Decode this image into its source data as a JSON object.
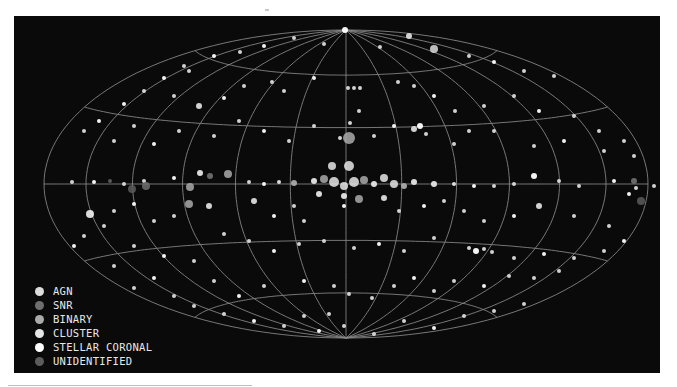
{
  "chart_data": {
    "type": "scatter",
    "title": "",
    "projection": "Hammer-Aitoff all-sky (galactic coordinates)",
    "grid": {
      "on": true,
      "meridians_deg": [
        -180,
        -150,
        -120,
        -90,
        -60,
        -30,
        0,
        30,
        60,
        90,
        120,
        150,
        180
      ],
      "parallels_deg": [
        -60,
        -30,
        0,
        30,
        60
      ],
      "color": "#8a8a8a"
    },
    "background": "#0a0a0a",
    "legend_position": "lower-left",
    "legend": [
      {
        "name": "AGN",
        "color": "#dcdcdc"
      },
      {
        "name": "SNR",
        "color": "#6e6e6e"
      },
      {
        "name": "BINARY",
        "color": "#aaaaaa"
      },
      {
        "name": "CLUSTER",
        "color": "#e6e6e6"
      },
      {
        "name": "STELLAR CORONAL",
        "color": "#ffffff"
      },
      {
        "name": "UNIDENTIFIED",
        "color": "#5c5c5c"
      }
    ],
    "ellipse": {
      "cx": 332,
      "cy": 168,
      "rx": 302,
      "ry": 154
    },
    "points": [
      [
        331,
        14,
        3,
        "STELLAR CORONAL"
      ],
      [
        395,
        20,
        3,
        "AGN"
      ],
      [
        420,
        33,
        4,
        "AGN"
      ],
      [
        366,
        31,
        2,
        "AGN"
      ],
      [
        310,
        28,
        2,
        "AGN"
      ],
      [
        280,
        22,
        2,
        "AGN"
      ],
      [
        250,
        30,
        2,
        "STELLAR CORONAL"
      ],
      [
        226,
        36,
        2,
        "AGN"
      ],
      [
        200,
        40,
        2,
        "STELLAR CORONAL"
      ],
      [
        455,
        40,
        2,
        "AGN"
      ],
      [
        480,
        46,
        2,
        "STELLAR CORONAL"
      ],
      [
        510,
        55,
        2,
        "AGN"
      ],
      [
        540,
        60,
        2,
        "AGN"
      ],
      [
        170,
        50,
        2,
        "AGN"
      ],
      [
        150,
        62,
        2,
        "STELLAR CORONAL"
      ],
      [
        130,
        75,
        2,
        "AGN"
      ],
      [
        110,
        88,
        2,
        "STELLAR CORONAL"
      ],
      [
        175,
        55,
        2,
        "AGN"
      ],
      [
        160,
        80,
        2,
        "AGN"
      ],
      [
        185,
        90,
        3,
        "AGN"
      ],
      [
        210,
        82,
        2,
        "STELLAR CORONAL"
      ],
      [
        230,
        70,
        2,
        "AGN"
      ],
      [
        258,
        66,
        2,
        "AGN"
      ],
      [
        270,
        75,
        2,
        "AGN"
      ],
      [
        300,
        62,
        2,
        "STELLAR CORONAL"
      ],
      [
        334,
        72,
        2,
        "AGN"
      ],
      [
        340,
        72,
        2,
        "AGN"
      ],
      [
        346,
        72,
        2,
        "AGN"
      ],
      [
        384,
        66,
        2,
        "AGN"
      ],
      [
        400,
        70,
        2,
        "AGN"
      ],
      [
        420,
        80,
        2,
        "STELLAR CORONAL"
      ],
      [
        441,
        95,
        2,
        "AGN"
      ],
      [
        455,
        115,
        2,
        "AGN"
      ],
      [
        470,
        90,
        2,
        "AGN"
      ],
      [
        500,
        80,
        2,
        "AGN"
      ],
      [
        525,
        95,
        2,
        "STELLAR CORONAL"
      ],
      [
        560,
        100,
        2,
        "AGN"
      ],
      [
        585,
        115,
        2,
        "AGN"
      ],
      [
        610,
        125,
        2,
        "AGN"
      ],
      [
        70,
        115,
        2,
        "AGN"
      ],
      [
        85,
        105,
        2,
        "STELLAR CORONAL"
      ],
      [
        100,
        125,
        2,
        "AGN"
      ],
      [
        120,
        110,
        2,
        "AGN"
      ],
      [
        140,
        128,
        2,
        "STELLAR CORONAL"
      ],
      [
        165,
        115,
        2,
        "AGN"
      ],
      [
        200,
        120,
        2,
        "AGN"
      ],
      [
        225,
        105,
        2,
        "AGN"
      ],
      [
        250,
        115,
        2,
        "STELLAR CORONAL"
      ],
      [
        275,
        125,
        2,
        "AGN"
      ],
      [
        300,
        110,
        2,
        "AGN"
      ],
      [
        326,
        122,
        2,
        "AGN"
      ],
      [
        336,
        107,
        2,
        "AGN"
      ],
      [
        345,
        95,
        2,
        "AGN"
      ],
      [
        360,
        120,
        2,
        "AGN"
      ],
      [
        380,
        110,
        2,
        "STELLAR CORONAL"
      ],
      [
        400,
        113,
        3,
        "AGN"
      ],
      [
        406,
        110,
        3,
        "STELLAR CORONAL"
      ],
      [
        412,
        118,
        2,
        "AGN"
      ],
      [
        440,
        128,
        2,
        "AGN"
      ],
      [
        480,
        115,
        2,
        "AGN"
      ],
      [
        520,
        130,
        2,
        "AGN"
      ],
      [
        550,
        125,
        2,
        "STELLAR CORONAL"
      ],
      [
        590,
        135,
        2,
        "AGN"
      ],
      [
        620,
        140,
        2,
        "AGN"
      ],
      [
        335,
        122,
        6,
        "BINARY"
      ],
      [
        318,
        150,
        4,
        "CLUSTER"
      ],
      [
        335,
        150,
        5,
        "CLUSTER"
      ],
      [
        300,
        165,
        3,
        "CLUSTER"
      ],
      [
        310,
        163,
        4,
        "BINARY"
      ],
      [
        320,
        166,
        5,
        "CLUSTER"
      ],
      [
        330,
        170,
        4,
        "CLUSTER"
      ],
      [
        340,
        166,
        5,
        "CLUSTER"
      ],
      [
        350,
        164,
        4,
        "BINARY"
      ],
      [
        360,
        168,
        3,
        "CLUSTER"
      ],
      [
        370,
        162,
        4,
        "CLUSTER"
      ],
      [
        380,
        168,
        4,
        "CLUSTER"
      ],
      [
        390,
        170,
        3,
        "BINARY"
      ],
      [
        400,
        166,
        3,
        "CLUSTER"
      ],
      [
        330,
        180,
        3,
        "CLUSTER"
      ],
      [
        345,
        183,
        4,
        "BINARY"
      ],
      [
        305,
        178,
        3,
        "CLUSTER"
      ],
      [
        280,
        167,
        3,
        "BINARY"
      ],
      [
        265,
        166,
        2,
        "CLUSTER"
      ],
      [
        250,
        168,
        2,
        "STELLAR CORONAL"
      ],
      [
        235,
        166,
        2,
        "AGN"
      ],
      [
        420,
        168,
        3,
        "CLUSTER"
      ],
      [
        440,
        168,
        2,
        "CLUSTER"
      ],
      [
        460,
        170,
        2,
        "STELLAR CORONAL"
      ],
      [
        480,
        170,
        2,
        "AGN"
      ],
      [
        214,
        158,
        4,
        "BINARY"
      ],
      [
        186,
        157,
        3,
        "CLUSTER"
      ],
      [
        196,
        160,
        3,
        "SNR"
      ],
      [
        160,
        162,
        2,
        "STELLAR CORONAL"
      ],
      [
        130,
        165,
        2,
        "AGN"
      ],
      [
        110,
        168,
        2,
        "AGN"
      ],
      [
        80,
        166,
        2,
        "STELLAR CORONAL"
      ],
      [
        58,
        166,
        2,
        "AGN"
      ],
      [
        96,
        165,
        2,
        "UNIDENTIFIED"
      ],
      [
        132,
        170,
        4,
        "SNR"
      ],
      [
        118,
        173,
        4,
        "UNIDENTIFIED"
      ],
      [
        176,
        171,
        4,
        "BINARY"
      ],
      [
        500,
        168,
        2,
        "AGN"
      ],
      [
        520,
        160,
        3,
        "STELLAR CORONAL"
      ],
      [
        545,
        165,
        2,
        "AGN"
      ],
      [
        565,
        170,
        2,
        "AGN"
      ],
      [
        600,
        165,
        2,
        "STELLAR CORONAL"
      ],
      [
        620,
        165,
        3,
        "SNR"
      ],
      [
        622,
        172,
        2,
        "AGN"
      ],
      [
        627,
        185,
        4,
        "UNIDENTIFIED"
      ],
      [
        615,
        178,
        2,
        "STELLAR CORONAL"
      ],
      [
        640,
        170,
        2,
        "AGN"
      ],
      [
        175,
        188,
        4,
        "BINARY"
      ],
      [
        160,
        200,
        2,
        "AGN"
      ],
      [
        140,
        205,
        2,
        "AGN"
      ],
      [
        120,
        188,
        2,
        "STELLAR CORONAL"
      ],
      [
        100,
        195,
        2,
        "AGN"
      ],
      [
        76,
        198,
        4,
        "STELLAR CORONAL"
      ],
      [
        90,
        210,
        2,
        "AGN"
      ],
      [
        70,
        220,
        2,
        "AGN"
      ],
      [
        60,
        230,
        2,
        "STELLAR CORONAL"
      ],
      [
        195,
        190,
        3,
        "AGN"
      ],
      [
        240,
        185,
        3,
        "AGN"
      ],
      [
        260,
        200,
        2,
        "STELLAR CORONAL"
      ],
      [
        280,
        190,
        2,
        "AGN"
      ],
      [
        290,
        205,
        2,
        "AGN"
      ],
      [
        330,
        190,
        2,
        "STELLAR CORONAL"
      ],
      [
        370,
        182,
        3,
        "AGN"
      ],
      [
        385,
        195,
        2,
        "AGN"
      ],
      [
        410,
        190,
        2,
        "STELLAR CORONAL"
      ],
      [
        430,
        185,
        2,
        "AGN"
      ],
      [
        450,
        195,
        2,
        "AGN"
      ],
      [
        470,
        205,
        2,
        "AGN"
      ],
      [
        500,
        200,
        2,
        "STELLAR CORONAL"
      ],
      [
        525,
        190,
        3,
        "AGN"
      ],
      [
        560,
        200,
        2,
        "AGN"
      ],
      [
        595,
        210,
        2,
        "AGN"
      ],
      [
        610,
        225,
        2,
        "STELLAR CORONAL"
      ],
      [
        210,
        218,
        2,
        "AGN"
      ],
      [
        235,
        225,
        2,
        "AGN"
      ],
      [
        260,
        235,
        2,
        "STELLAR CORONAL"
      ],
      [
        285,
        228,
        2,
        "AGN"
      ],
      [
        310,
        225,
        2,
        "AGN"
      ],
      [
        340,
        232,
        2,
        "AGN"
      ],
      [
        365,
        228,
        2,
        "STELLAR CORONAL"
      ],
      [
        390,
        235,
        2,
        "AGN"
      ],
      [
        420,
        222,
        2,
        "AGN"
      ],
      [
        455,
        232,
        2,
        "AGN"
      ],
      [
        462,
        235,
        3,
        "STELLAR CORONAL"
      ],
      [
        470,
        233,
        2,
        "AGN"
      ],
      [
        478,
        236,
        2,
        "AGN"
      ],
      [
        500,
        242,
        2,
        "AGN"
      ],
      [
        530,
        238,
        2,
        "STELLAR CORONAL"
      ],
      [
        560,
        242,
        2,
        "AGN"
      ],
      [
        590,
        235,
        2,
        "AGN"
      ],
      [
        120,
        230,
        2,
        "AGN"
      ],
      [
        150,
        240,
        2,
        "STELLAR CORONAL"
      ],
      [
        180,
        245,
        2,
        "AGN"
      ],
      [
        100,
        250,
        2,
        "AGN"
      ],
      [
        290,
        265,
        2,
        "STELLAR CORONAL"
      ],
      [
        320,
        270,
        2,
        "AGN"
      ],
      [
        335,
        278,
        2,
        "AGN"
      ],
      [
        358,
        282,
        2,
        "AGN"
      ],
      [
        380,
        270,
        2,
        "AGN"
      ],
      [
        400,
        262,
        2,
        "STELLAR CORONAL"
      ],
      [
        420,
        275,
        2,
        "AGN"
      ],
      [
        440,
        265,
        2,
        "AGN"
      ],
      [
        470,
        270,
        2,
        "STELLAR CORONAL"
      ],
      [
        495,
        260,
        2,
        "AGN"
      ],
      [
        520,
        262,
        2,
        "AGN"
      ],
      [
        545,
        255,
        2,
        "AGN"
      ],
      [
        200,
        265,
        2,
        "AGN"
      ],
      [
        225,
        280,
        2,
        "STELLAR CORONAL"
      ],
      [
        250,
        270,
        2,
        "AGN"
      ],
      [
        160,
        280,
        2,
        "AGN"
      ],
      [
        140,
        262,
        2,
        "STELLAR CORONAL"
      ],
      [
        120,
        272,
        2,
        "AGN"
      ],
      [
        180,
        290,
        2,
        "AGN"
      ],
      [
        210,
        298,
        2,
        "AGN"
      ],
      [
        240,
        305,
        2,
        "STELLAR CORONAL"
      ],
      [
        270,
        310,
        2,
        "AGN"
      ],
      [
        305,
        315,
        2,
        "STELLAR CORONAL"
      ],
      [
        330,
        310,
        2,
        "AGN"
      ],
      [
        360,
        318,
        2,
        "AGN"
      ],
      [
        390,
        305,
        2,
        "AGN"
      ],
      [
        420,
        312,
        2,
        "STELLAR CORONAL"
      ],
      [
        450,
        300,
        2,
        "AGN"
      ],
      [
        480,
        295,
        2,
        "AGN"
      ],
      [
        510,
        288,
        2,
        "AGN"
      ],
      [
        290,
        300,
        2,
        "AGN"
      ],
      [
        315,
        298,
        2,
        "AGN"
      ]
    ]
  }
}
